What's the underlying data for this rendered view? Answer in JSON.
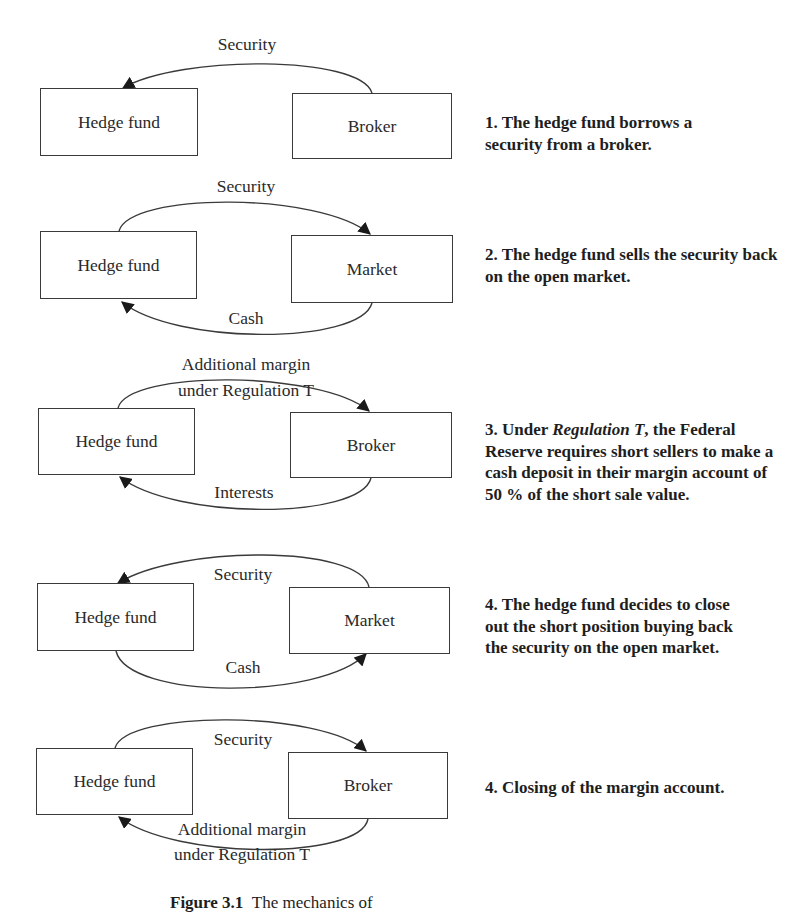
{
  "diagram": {
    "steps": [
      {
        "id": 1,
        "left_box": "Hedge fund",
        "right_box": "Broker",
        "top_flow": {
          "label": "Security",
          "direction": "right-to-left"
        },
        "bottom_flow": null,
        "caption": "1. The hedge fund borrows a security from a broker."
      },
      {
        "id": 2,
        "left_box": "Hedge fund",
        "right_box": "Market",
        "top_flow": {
          "label": "Security",
          "direction": "left-to-right"
        },
        "bottom_flow": {
          "label": "Cash",
          "direction": "right-to-left"
        },
        "caption": "2. The hedge fund sells the security back on the open market."
      },
      {
        "id": 3,
        "left_box": "Hedge fund",
        "right_box": "Broker",
        "top_flow": {
          "label_line1": "Additional margin",
          "label_line2": "under Regulation T",
          "direction": "left-to-right"
        },
        "bottom_flow": {
          "label": "Interests",
          "direction": "right-to-left"
        },
        "caption_prefix": "3. Under ",
        "caption_italic": "Regulation T",
        "caption_suffix": ", the Federal Reserve requires short sellers to make a cash deposit in their margin account of 50 % of the short sale value."
      },
      {
        "id": 4,
        "left_box": "Hedge fund",
        "right_box": "Market",
        "top_flow": {
          "label": "Security",
          "direction": "right-to-left"
        },
        "bottom_flow": {
          "label": "Cash",
          "direction": "left-to-right"
        },
        "caption": "4. The hedge fund decides to close out the short position buying back the security on the open market."
      },
      {
        "id": 5,
        "left_box": "Hedge fund",
        "right_box": "Broker",
        "top_flow": {
          "label": "Security",
          "direction": "left-to-right"
        },
        "bottom_flow": {
          "label_line1": "Additional margin",
          "label_line2": "under Regulation T",
          "direction": "right-to-left"
        },
        "caption": "4. Closing of the margin account."
      }
    ],
    "figure_caption_label": "Figure 3.1",
    "figure_caption_text": "The mechanics of"
  },
  "colors": {
    "line": "#3a3a3a",
    "text": "#262626",
    "background": "#ffffff"
  }
}
